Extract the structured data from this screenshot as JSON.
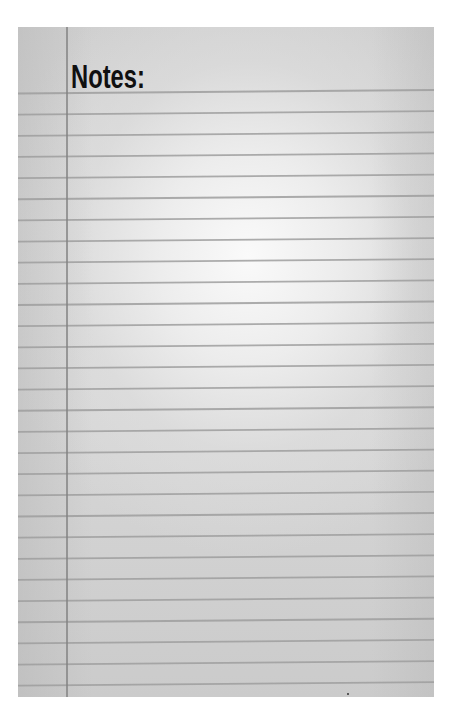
{
  "page": {
    "title": "Notes:"
  },
  "paper": {
    "left": 18,
    "top": 27,
    "width": 416,
    "height": 670,
    "rule_count": 29,
    "first_rule_y": 66.5,
    "rule_spacing": 21.15,
    "rule_tilt_px": -3.5,
    "rule_color": "#9e9e9e",
    "margin_line_x": 48,
    "margin_line_color": "#828282"
  }
}
